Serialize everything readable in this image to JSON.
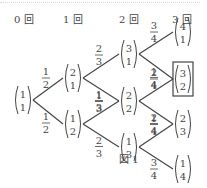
{
  "headers": [
    "0 回",
    "1 回",
    "2 回",
    "3 回"
  ],
  "caption": "図 1",
  "nodes": [
    {
      "id": "n0",
      "top": "1",
      "bottom": "1",
      "stage": 0
    },
    {
      "id": "n1a",
      "top": "2",
      "bottom": "1",
      "stage": 1
    },
    {
      "id": "n1b",
      "top": "1",
      "bottom": "2",
      "stage": 1
    },
    {
      "id": "n2a",
      "top": "3",
      "bottom": "1",
      "stage": 2
    },
    {
      "id": "n2b",
      "top": "2",
      "bottom": "2",
      "stage": 2
    },
    {
      "id": "n2c",
      "top": "1",
      "bottom": "3",
      "stage": 2
    },
    {
      "id": "n3a",
      "top": "4",
      "bottom": "1",
      "stage": 3
    },
    {
      "id": "n3b",
      "top": "3",
      "bottom": "2",
      "stage": 3,
      "boxed": true
    },
    {
      "id": "n3c",
      "top": "2",
      "bottom": "3",
      "stage": 3
    },
    {
      "id": "n3d",
      "top": "1",
      "bottom": "4",
      "stage": 3
    }
  ],
  "edges": [
    {
      "from": "n0",
      "to": "n1a",
      "num": "1",
      "den": "2"
    },
    {
      "from": "n0",
      "to": "n1b",
      "num": "1",
      "den": "2"
    },
    {
      "from": "n1a",
      "to": "n2a",
      "num": "2",
      "den": "3"
    },
    {
      "from": "n1a",
      "to": "n2b",
      "num": "1",
      "den": "3"
    },
    {
      "from": "n1b",
      "to": "n2b",
      "num": "1",
      "den": "3"
    },
    {
      "from": "n1b",
      "to": "n2c",
      "num": "2",
      "den": "3"
    },
    {
      "from": "n2a",
      "to": "n3a",
      "num": "3",
      "den": "4"
    },
    {
      "from": "n2a",
      "to": "n3b",
      "num": "1",
      "den": "4"
    },
    {
      "from": "n2b",
      "to": "n3b",
      "num": "2",
      "den": "4"
    },
    {
      "from": "n2b",
      "to": "n3c",
      "num": "2",
      "den": "4"
    },
    {
      "from": "n2c",
      "to": "n3c",
      "num": "1",
      "den": "4"
    },
    {
      "from": "n2c",
      "to": "n3d",
      "num": "3",
      "den": "4"
    }
  ]
}
